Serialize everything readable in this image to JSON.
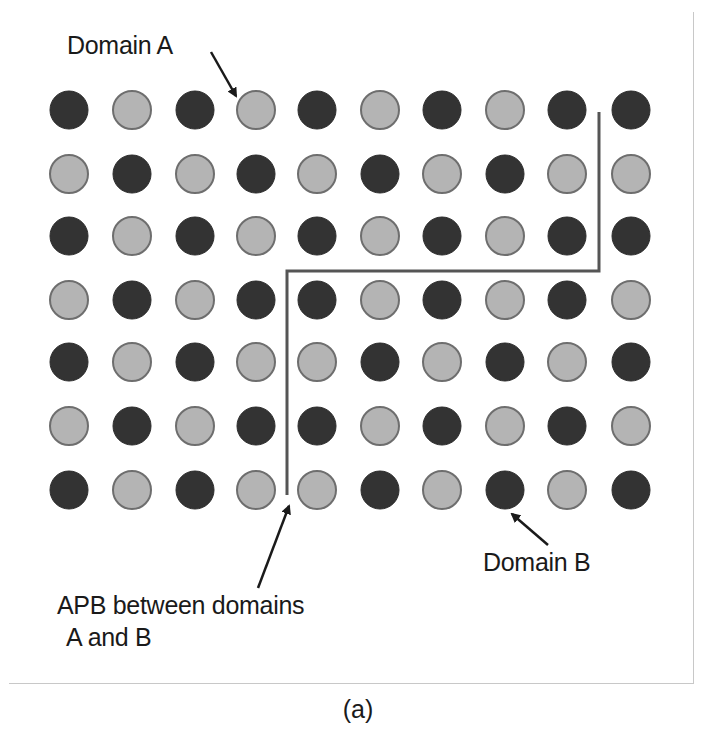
{
  "figure": {
    "caption": "(a)",
    "labels": {
      "domain_a": "Domain A",
      "domain_b": "Domain B",
      "apb_line1": "APB between domains",
      "apb_line2": "A and B"
    },
    "colors": {
      "dark_atom": "#333333",
      "light_atom_fill": "#b4b4b4",
      "light_atom_stroke": "#6e6e6e",
      "boundary_line": "#555555",
      "arrow": "#1a1a1a",
      "frame": "#c8c8c8"
    },
    "lattice": {
      "rows": 7,
      "cols": 10,
      "legend": {
        "D": "dark atom",
        "L": "light atom"
      },
      "grid": [
        [
          "D",
          "L",
          "D",
          "L",
          "D",
          "L",
          "D",
          "L",
          "D",
          "D"
        ],
        [
          "L",
          "D",
          "L",
          "D",
          "L",
          "D",
          "L",
          "D",
          "L",
          "L"
        ],
        [
          "D",
          "L",
          "D",
          "L",
          "D",
          "L",
          "D",
          "L",
          "D",
          "D"
        ],
        [
          "L",
          "D",
          "L",
          "D",
          "D",
          "L",
          "D",
          "L",
          "D",
          "L"
        ],
        [
          "D",
          "L",
          "D",
          "L",
          "L",
          "D",
          "L",
          "D",
          "L",
          "D"
        ],
        [
          "L",
          "D",
          "L",
          "D",
          "D",
          "L",
          "D",
          "L",
          "D",
          "L"
        ],
        [
          "D",
          "L",
          "D",
          "L",
          "L",
          "D",
          "L",
          "D",
          "L",
          "D"
        ]
      ],
      "col_x": [
        69,
        132,
        195,
        256,
        317,
        380,
        442,
        505,
        567,
        631
      ],
      "row_y": [
        110,
        174,
        236,
        300,
        362,
        426,
        490
      ],
      "radius": 19
    },
    "boundary_path": [
      [
        599,
        112
      ],
      [
        599,
        271
      ],
      [
        287,
        271
      ],
      [
        287,
        495
      ]
    ],
    "arrows": {
      "domain_a": {
        "from": [
          211,
          52
        ],
        "to": [
          236,
          96
        ]
      },
      "domain_b": {
        "from": [
          548,
          545
        ],
        "to": [
          512,
          514
        ]
      },
      "apb": {
        "from": [
          258,
          588
        ],
        "to": [
          289,
          506
        ]
      }
    }
  }
}
